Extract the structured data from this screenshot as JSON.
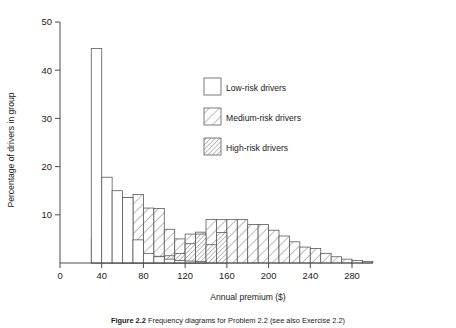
{
  "figure": {
    "caption_prefix": "Figure 2.2",
    "caption_text": "Frequency diagrams for Problem 2.2 (see also Exercise 2.2)"
  },
  "chart_data": {
    "type": "bar",
    "subtype": "overlaid-histogram",
    "title": "",
    "xlabel": "Annual premium ($)",
    "ylabel": "Percentage of drivers in group",
    "xlim": [
      0,
      300
    ],
    "ylim": [
      0,
      50
    ],
    "xticks": [
      0,
      40,
      80,
      120,
      160,
      200,
      240,
      280
    ],
    "yticks": [
      10,
      20,
      30,
      40,
      50
    ],
    "bin_width": 10,
    "grid": false,
    "legend_position": "upper-right-inside",
    "series": [
      {
        "name": "Low-risk drivers",
        "fill": "white",
        "pattern": "none",
        "bin_starts": [
          30,
          40,
          50,
          60,
          70,
          80,
          90,
          100,
          110,
          120,
          130
        ],
        "values": [
          44.5,
          17.8,
          15.0,
          13.6,
          4.8,
          2.0,
          1.3,
          0.8,
          0.5,
          0.4,
          0.3
        ]
      },
      {
        "name": "Medium-risk drivers",
        "fill": "hatch-sparse",
        "pattern": "diagonal-45-sparse",
        "bin_starts": [
          30,
          40,
          50,
          60,
          70,
          80,
          90,
          100,
          110,
          120,
          130,
          140,
          150,
          160,
          170,
          180,
          190,
          200,
          210,
          220,
          230,
          240,
          250,
          260,
          270,
          280,
          290
        ],
        "values": [
          5.0,
          9.0,
          11.8,
          13.6,
          14.2,
          11.4,
          11.3,
          7.0,
          5.0,
          6.0,
          6.4,
          9.0,
          9.0,
          9.0,
          9.0,
          8.0,
          8.0,
          6.8,
          5.6,
          4.4,
          3.3,
          3.0,
          2.0,
          1.3,
          0.8,
          0.5,
          0.3
        ]
      },
      {
        "name": "High-risk drivers",
        "fill": "hatch-dense",
        "pattern": "diagonal-45-dense",
        "bin_starts": [
          60,
          70,
          80,
          90,
          100,
          110,
          120,
          130,
          140,
          150
        ],
        "values": [
          0.5,
          0.6,
          1.2,
          1.4,
          1.5,
          2.0,
          4.0,
          6.0,
          3.8,
          6.3
        ]
      }
    ]
  },
  "legend": {
    "items": [
      {
        "label": "Low-risk drivers",
        "swatch": "swatch-empty"
      },
      {
        "label": "Medium-risk drivers",
        "swatch": "swatch-hatch-sparse"
      },
      {
        "label": "High-risk drivers",
        "swatch": "swatch-hatch-dense"
      }
    ]
  }
}
